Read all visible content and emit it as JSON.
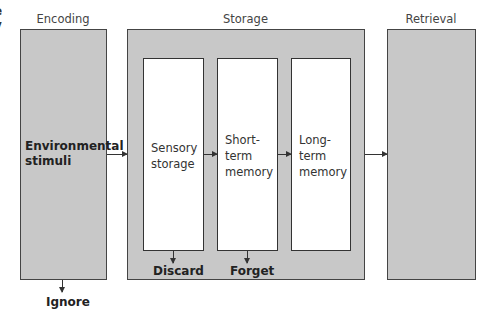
{
  "stages": {
    "encoding": {
      "label": "Encoding",
      "content": "Environmental\nstimuli",
      "exit": "Ignore"
    },
    "storage": {
      "label": "Storage",
      "stores": [
        {
          "label": "Sensory\nstorage",
          "exit": "Discard"
        },
        {
          "label": "Short-\nterm\nmemory",
          "exit": "Forget"
        },
        {
          "label": "Long-\nterm\nmemory"
        }
      ]
    },
    "retrieval": {
      "label": "Retrieval"
    }
  },
  "fragment": {
    "text": "e\ny"
  },
  "colors": {
    "box_fill": "#c8c8c8",
    "store_fill": "#ffffff",
    "border": "#444444"
  }
}
